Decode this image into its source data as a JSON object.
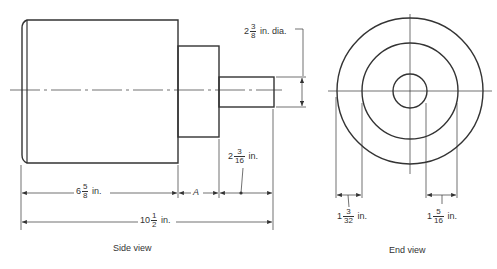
{
  "side_view": {
    "caption": "Side view",
    "dims": {
      "shaft_dia": {
        "whole": "2",
        "num": "3",
        "den": "8",
        "unit": "in. dia."
      },
      "shaft_len": {
        "whole": "2",
        "num": "3",
        "den": "16",
        "unit": "in."
      },
      "body_len": {
        "whole": "6",
        "num": "5",
        "den": "8",
        "unit": "in."
      },
      "step_len": {
        "label": "A"
      },
      "total_len": {
        "whole": "10",
        "num": "1",
        "den": "2",
        "unit": "in."
      }
    }
  },
  "end_view": {
    "caption": "End view",
    "dims": {
      "left_gap": {
        "whole": "1",
        "num": "3",
        "den": "32",
        "unit": "in."
      },
      "right_gap": {
        "whole": "1",
        "num": "5",
        "den": "16",
        "unit": "in."
      }
    }
  }
}
